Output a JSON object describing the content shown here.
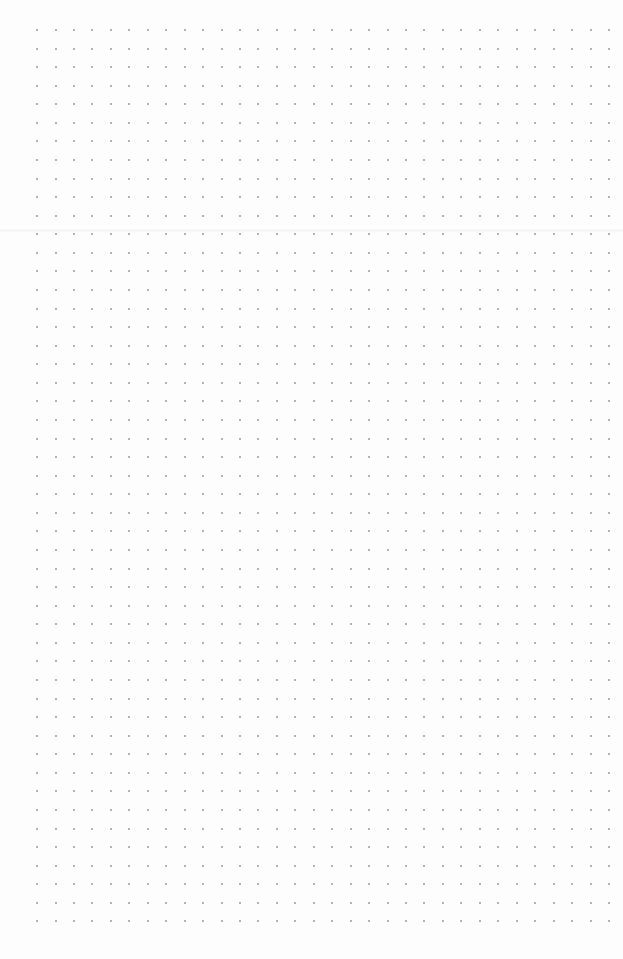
{
  "page": {
    "type": "dot-grid-paper",
    "background": "#fdfdfd",
    "dot_color": "#9a9a9a",
    "grid": {
      "columns": 32,
      "rows": 49,
      "origin_x": 37,
      "origin_y": 30,
      "spacing_x": 18.45,
      "spacing_y": 18.57,
      "dot_size": 2
    },
    "fold_line_y": 229
  }
}
